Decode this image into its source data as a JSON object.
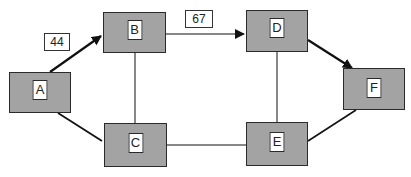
{
  "diagram": {
    "nodes": [
      {
        "id": "A",
        "label": "A"
      },
      {
        "id": "B",
        "label": "B"
      },
      {
        "id": "C",
        "label": "C"
      },
      {
        "id": "D",
        "label": "D"
      },
      {
        "id": "E",
        "label": "E"
      },
      {
        "id": "F",
        "label": "F"
      }
    ],
    "edges": [
      {
        "from": "A",
        "to": "B",
        "directed": true,
        "label": "44"
      },
      {
        "from": "B",
        "to": "D",
        "directed": true,
        "label": "67"
      },
      {
        "from": "D",
        "to": "F",
        "directed": true,
        "label": ""
      },
      {
        "from": "A",
        "to": "C",
        "directed": false,
        "label": ""
      },
      {
        "from": "B",
        "to": "C",
        "directed": false,
        "label": ""
      },
      {
        "from": "C",
        "to": "E",
        "directed": false,
        "label": ""
      },
      {
        "from": "D",
        "to": "E",
        "directed": false,
        "label": ""
      },
      {
        "from": "E",
        "to": "F",
        "directed": false,
        "label": ""
      }
    ],
    "colors": {
      "node_fill": "#a3a3a3",
      "stroke": "#2a2a2a",
      "label_fill": "#ffffff"
    }
  }
}
